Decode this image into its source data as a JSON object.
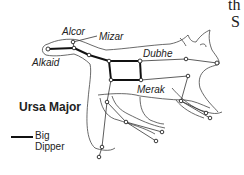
{
  "diagram": {
    "title": "Ursa Major",
    "legend": {
      "line_label_1": "Big",
      "line_label_2": "Dipper",
      "line_color": "#111111"
    },
    "stars": [
      {
        "name": "Alkaid",
        "label": "Alkaid"
      },
      {
        "name": "Alcor",
        "label": "Alcor"
      },
      {
        "name": "Mizar",
        "label": "Mizar"
      },
      {
        "name": "Dubhe",
        "label": "Dubhe"
      },
      {
        "name": "Merak",
        "label": "Merak"
      }
    ],
    "corner_text": {
      "line1": "th",
      "line2": "S"
    },
    "colors": {
      "ink": "#222222",
      "background": "#ffffff"
    }
  }
}
